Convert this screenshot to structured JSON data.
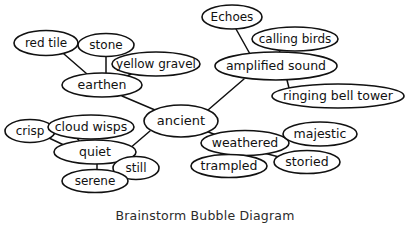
{
  "caption": "Brainstorm Bubble Diagram",
  "colors": {
    "background": "#ffffff",
    "bubble_fill": "#ffffff",
    "stroke": "#111111",
    "caption_text": "#2b2b2b"
  },
  "diagram": {
    "type": "bubble-map",
    "center_node": "ancient",
    "nodes": [
      {
        "id": "red-tile",
        "label": "red tile",
        "cx": 46,
        "cy": 43,
        "rx": 32,
        "ry": 12.5,
        "font": 12
      },
      {
        "id": "stone",
        "label": "stone",
        "cx": 106,
        "cy": 45,
        "rx": 28,
        "ry": 11.5,
        "font": 12
      },
      {
        "id": "yellow-gravel",
        "label": "yellow gravel",
        "cx": 156,
        "cy": 64,
        "rx": 44,
        "ry": 12,
        "font": 12
      },
      {
        "id": "earthen",
        "label": "earthen",
        "cx": 102,
        "cy": 85,
        "rx": 40,
        "ry": 12,
        "font": 12.5
      },
      {
        "id": "echoes",
        "label": "Echoes",
        "cx": 232,
        "cy": 17,
        "rx": 30,
        "ry": 12,
        "font": 12
      },
      {
        "id": "calling-birds",
        "label": "calling birds",
        "cx": 295,
        "cy": 39,
        "rx": 43,
        "ry": 12,
        "font": 12
      },
      {
        "id": "amplified-sound",
        "label": "amplified sound",
        "cx": 276,
        "cy": 66,
        "rx": 61,
        "ry": 14,
        "font": 12.5
      },
      {
        "id": "ringing-bell-tower",
        "label": "ringing bell tower",
        "cx": 338,
        "cy": 96,
        "rx": 66,
        "ry": 12,
        "font": 12.5
      },
      {
        "id": "ancient",
        "label": "ancient",
        "cx": 181,
        "cy": 121,
        "rx": 37,
        "ry": 16,
        "font": 13
      },
      {
        "id": "crisp",
        "label": "crisp",
        "cx": 30,
        "cy": 131,
        "rx": 25,
        "ry": 11.5,
        "font": 12
      },
      {
        "id": "cloud-wisps",
        "label": "cloud wisps",
        "cx": 91,
        "cy": 127,
        "rx": 43,
        "ry": 12,
        "font": 12.5
      },
      {
        "id": "quiet",
        "label": "quiet",
        "cx": 95,
        "cy": 152,
        "rx": 41,
        "ry": 12,
        "font": 12.5
      },
      {
        "id": "still",
        "label": "still",
        "cx": 136,
        "cy": 168,
        "rx": 23,
        "ry": 11.5,
        "font": 12
      },
      {
        "id": "serene",
        "label": "serene",
        "cx": 95,
        "cy": 181,
        "rx": 33,
        "ry": 11.5,
        "font": 12
      },
      {
        "id": "weathered",
        "label": "weathered",
        "cx": 245,
        "cy": 143,
        "rx": 44,
        "ry": 12.5,
        "font": 12.5
      },
      {
        "id": "majestic",
        "label": "majestic",
        "cx": 320,
        "cy": 134,
        "rx": 37,
        "ry": 12,
        "font": 12.5
      },
      {
        "id": "storied",
        "label": "storied",
        "cx": 307,
        "cy": 162,
        "rx": 33,
        "ry": 11.5,
        "font": 12.5
      },
      {
        "id": "trampled",
        "label": "trampled",
        "cx": 229,
        "cy": 166,
        "rx": 38,
        "ry": 11.5,
        "font": 12.5
      }
    ],
    "edges": [
      {
        "from": "ancient",
        "to": "earthen",
        "x1": 155,
        "y1": 110,
        "x2": 122,
        "y2": 96
      },
      {
        "from": "ancient",
        "to": "amplified-sound",
        "x1": 208,
        "y1": 110,
        "x2": 244,
        "y2": 79
      },
      {
        "from": "ancient",
        "to": "weathered",
        "x1": 206,
        "y1": 131,
        "x2": 221,
        "y2": 137
      },
      {
        "from": "ancient",
        "to": "quiet",
        "x1": 150,
        "y1": 131,
        "x2": 129,
        "y2": 149
      },
      {
        "from": "earthen",
        "to": "red-tile",
        "x1": 87,
        "y1": 74,
        "x2": 64,
        "y2": 54
      },
      {
        "from": "earthen",
        "to": "stone",
        "x1": 106,
        "y1": 74,
        "x2": 106,
        "y2": 57
      },
      {
        "from": "earthen",
        "to": "yellow-gravel",
        "x1": 127,
        "y1": 76,
        "x2": 135,
        "y2": 72
      },
      {
        "from": "amplified-sound",
        "to": "echoes",
        "x1": 250,
        "y1": 54,
        "x2": 236,
        "y2": 29
      },
      {
        "from": "amplified-sound",
        "to": "calling-birds",
        "x1": 279,
        "y1": 53,
        "x2": 281,
        "y2": 48
      },
      {
        "from": "amplified-sound",
        "to": "ringing-bell-tower",
        "x1": 287,
        "y1": 80,
        "x2": 289,
        "y2": 88
      },
      {
        "from": "quiet",
        "to": "crisp",
        "x1": 66,
        "y1": 146,
        "x2": 49,
        "y2": 138
      },
      {
        "from": "quiet",
        "to": "cloud-wisps",
        "x1": 80,
        "y1": 142,
        "x2": 77,
        "y2": 138
      },
      {
        "from": "quiet",
        "to": "still",
        "x1": 117,
        "y1": 160,
        "x2": 126,
        "y2": 160
      },
      {
        "from": "quiet",
        "to": "serene",
        "x1": 97,
        "y1": 164,
        "x2": 97,
        "y2": 170
      },
      {
        "from": "weathered",
        "to": "majestic",
        "x1": 281,
        "y1": 139,
        "x2": 288,
        "y2": 137
      },
      {
        "from": "weathered",
        "to": "storied",
        "x1": 264,
        "y1": 153,
        "x2": 279,
        "y2": 157
      },
      {
        "from": "weathered",
        "to": "trampled",
        "x1": 231,
        "y1": 155,
        "x2": 230,
        "y2": 155
      }
    ]
  }
}
